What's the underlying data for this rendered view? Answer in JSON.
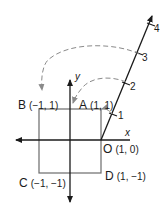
{
  "diagram": {
    "axes": {
      "x_label": "x",
      "y_label": "y"
    },
    "points": {
      "A": {
        "letter": "A",
        "coords": "(1, 1)"
      },
      "B": {
        "letter": "B",
        "coords": "(−1, 1)"
      },
      "C": {
        "letter": "C",
        "coords": "(−1, −1)"
      },
      "D": {
        "letter": "D",
        "coords": "(1, −1)"
      },
      "O": {
        "letter": "O",
        "coords": "(1, 0)"
      }
    },
    "ray_ticks": [
      "1",
      "2",
      "3",
      "4"
    ],
    "colors": {
      "square": "#6b6b6b",
      "axis": "#1a1a1a",
      "arc": "#8a8a8a"
    }
  }
}
